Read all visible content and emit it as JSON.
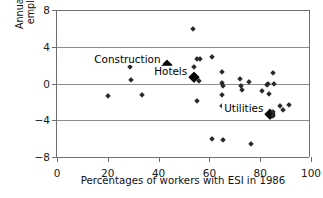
{
  "chart_data": {
    "type": "scatter",
    "title": "",
    "xlabel": "Percentages of workers with ESI in 1986",
    "ylabel": "Annual percentage change in employment, 1987 to 2005",
    "xlim": [
      0,
      100
    ],
    "ylim": [
      -8,
      8
    ],
    "xticks": [
      0,
      20,
      40,
      60,
      80,
      100
    ],
    "yticks": [
      8,
      4,
      0,
      -4,
      -8
    ],
    "xticklabels": [
      "0",
      "20",
      "40",
      "60",
      "80",
      "100"
    ],
    "yticklabels": [
      "8",
      "4",
      "0",
      "−4",
      "−8"
    ],
    "grid": "horizontal",
    "legend": "none",
    "marker": "diamond",
    "marker_color": "#2a2a2a",
    "points": [
      {
        "x": 20.0,
        "y": -1.4,
        "highlight": false
      },
      {
        "x": 28.8,
        "y": 1.8,
        "highlight": false
      },
      {
        "x": 29.0,
        "y": 0.4,
        "highlight": false
      },
      {
        "x": 33.5,
        "y": -1.3,
        "highlight": false
      },
      {
        "x": 43.5,
        "y": 2.0,
        "highlight": true,
        "label": "Construction"
      },
      {
        "x": 53.5,
        "y": 5.9,
        "highlight": false
      },
      {
        "x": 53.8,
        "y": 1.8,
        "highlight": false
      },
      {
        "x": 54.0,
        "y": 0.7,
        "highlight": true,
        "label": "Hotels"
      },
      {
        "x": 55.2,
        "y": 2.7,
        "highlight": false
      },
      {
        "x": 56.3,
        "y": 2.7,
        "highlight": false
      },
      {
        "x": 55.8,
        "y": 0.3,
        "highlight": false
      },
      {
        "x": 55.0,
        "y": -1.9,
        "highlight": false
      },
      {
        "x": 61.0,
        "y": 2.9,
        "highlight": false
      },
      {
        "x": 61.0,
        "y": -6.0,
        "highlight": false
      },
      {
        "x": 64.8,
        "y": 1.3,
        "highlight": false
      },
      {
        "x": 65.0,
        "y": 0.1,
        "highlight": false
      },
      {
        "x": 65.2,
        "y": -0.3,
        "highlight": false
      },
      {
        "x": 65.0,
        "y": -1.2,
        "highlight": false
      },
      {
        "x": 65.0,
        "y": -2.4,
        "highlight": false
      },
      {
        "x": 65.3,
        "y": -6.1,
        "highlight": false
      },
      {
        "x": 72.0,
        "y": 0.5,
        "highlight": false
      },
      {
        "x": 72.5,
        "y": -0.3,
        "highlight": false
      },
      {
        "x": 73.0,
        "y": -0.7,
        "highlight": false
      },
      {
        "x": 75.5,
        "y": 0.2,
        "highlight": false
      },
      {
        "x": 76.3,
        "y": -2.4,
        "highlight": false
      },
      {
        "x": 76.5,
        "y": -6.6,
        "highlight": false
      },
      {
        "x": 80.8,
        "y": -0.8,
        "highlight": false
      },
      {
        "x": 82.5,
        "y": -0.2,
        "highlight": false
      },
      {
        "x": 83.2,
        "y": -0.1,
        "highlight": false
      },
      {
        "x": 83.5,
        "y": -1.1,
        "highlight": false
      },
      {
        "x": 85.0,
        "y": 1.1,
        "highlight": false
      },
      {
        "x": 85.3,
        "y": 0.0,
        "highlight": false
      },
      {
        "x": 84.0,
        "y": -3.3,
        "highlight": true,
        "label": "Utilities"
      },
      {
        "x": 85.2,
        "y": -3.1,
        "highlight": false
      },
      {
        "x": 85.0,
        "y": -3.5,
        "highlight": false
      },
      {
        "x": 87.8,
        "y": -2.4,
        "highlight": false
      },
      {
        "x": 89.0,
        "y": -2.9,
        "highlight": false
      },
      {
        "x": 91.5,
        "y": -2.3,
        "highlight": false
      }
    ],
    "annotations": [
      {
        "text": "Construction",
        "x": 43.5,
        "y": 2.0
      },
      {
        "text": "Hotels",
        "x": 54.0,
        "y": 0.7
      },
      {
        "text": "Utilities",
        "x": 84.0,
        "y": -3.3
      }
    ]
  }
}
